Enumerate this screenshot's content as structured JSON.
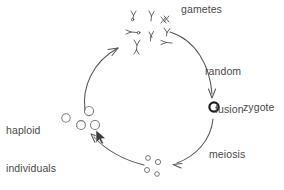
{
  "diagram": {
    "background_color": "#ffffff",
    "ink_color": "#4a4a4a",
    "labels": {
      "gametes": "gametes",
      "random_fusion_line1": "random",
      "random_fusion_line2": "fusion",
      "zygote": "zygote",
      "meiosis": "meiosis",
      "haploid_line1": "haploid",
      "haploid_line2": "individuals"
    },
    "stages": [
      {
        "name": "gametes",
        "icon": "chromosome-cluster-icon",
        "count": 8,
        "position": {
          "x": 152,
          "y": 33
        }
      },
      {
        "name": "zygote",
        "icon": "bold-circle-icon",
        "count": 1,
        "position": {
          "x": 214,
          "y": 107
        }
      },
      {
        "name": "meiotic-products",
        "icon": "small-circle-cluster-icon",
        "count": 4,
        "position": {
          "x": 158,
          "y": 165
        }
      },
      {
        "name": "haploid-individuals",
        "icon": "medium-circle-cluster-icon",
        "count": 4,
        "position": {
          "x": 80,
          "y": 120
        }
      }
    ],
    "arrows": [
      {
        "name": "arrow-gametes-to-zygote",
        "label": "random fusion",
        "from": "gametes",
        "to": "zygote"
      },
      {
        "name": "arrow-zygote-to-meiotic-products",
        "label": "meiosis",
        "from": "zygote",
        "to": "meiotic-products"
      },
      {
        "name": "arrow-meiotic-products-to-haploid-individuals",
        "label": "",
        "from": "meiotic-products",
        "to": "haploid-individuals"
      },
      {
        "name": "arrow-haploid-individuals-to-gametes",
        "label": "",
        "from": "haploid-individuals",
        "to": "gametes"
      }
    ],
    "cursor": {
      "name": "mouse-cursor",
      "x": 96,
      "y": 131
    }
  }
}
